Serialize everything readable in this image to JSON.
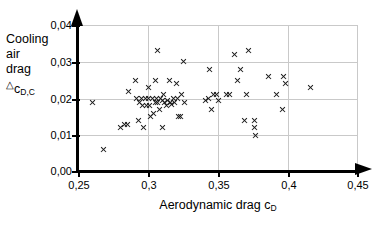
{
  "chart_data": {
    "type": "scatter",
    "title": "",
    "xlabel": "Aerodynamic drag c_D",
    "ylabel": "Cooling air drag Δc_D,C",
    "xlim": [
      0.25,
      0.45
    ],
    "ylim": [
      0.0,
      0.04
    ],
    "xticks": [
      "0,25",
      "0,3",
      "0,35",
      "0,4",
      "0,45"
    ],
    "xtick_values": [
      0.25,
      0.3,
      0.35,
      0.4,
      0.45
    ],
    "yticks": [
      "0,00",
      "0,01",
      "0,02",
      "0,03",
      "0,04"
    ],
    "ytick_values": [
      0.0,
      0.01,
      0.02,
      0.03,
      0.04
    ],
    "grid": true,
    "legend": false,
    "marker": "x",
    "marker_color": "#1a1a1a",
    "points": [
      [
        0.26,
        0.019
      ],
      [
        0.268,
        0.006
      ],
      [
        0.28,
        0.012
      ],
      [
        0.283,
        0.013
      ],
      [
        0.285,
        0.013
      ],
      [
        0.286,
        0.022
      ],
      [
        0.291,
        0.025
      ],
      [
        0.292,
        0.02
      ],
      [
        0.293,
        0.014
      ],
      [
        0.294,
        0.019
      ],
      [
        0.295,
        0.02
      ],
      [
        0.296,
        0.018
      ],
      [
        0.297,
        0.012
      ],
      [
        0.298,
        0.02
      ],
      [
        0.299,
        0.018
      ],
      [
        0.3,
        0.023
      ],
      [
        0.3,
        0.02
      ],
      [
        0.301,
        0.018
      ],
      [
        0.302,
        0.015
      ],
      [
        0.303,
        0.02
      ],
      [
        0.304,
        0.016
      ],
      [
        0.305,
        0.025
      ],
      [
        0.305,
        0.019
      ],
      [
        0.306,
        0.02
      ],
      [
        0.307,
        0.033
      ],
      [
        0.307,
        0.019
      ],
      [
        0.308,
        0.017
      ],
      [
        0.309,
        0.02
      ],
      [
        0.31,
        0.0195
      ],
      [
        0.31,
        0.012
      ],
      [
        0.311,
        0.021
      ],
      [
        0.312,
        0.019
      ],
      [
        0.313,
        0.018
      ],
      [
        0.314,
        0.0195
      ],
      [
        0.315,
        0.025
      ],
      [
        0.316,
        0.019
      ],
      [
        0.317,
        0.0185
      ],
      [
        0.318,
        0.02
      ],
      [
        0.319,
        0.019
      ],
      [
        0.32,
        0.024
      ],
      [
        0.321,
        0.02
      ],
      [
        0.322,
        0.015
      ],
      [
        0.323,
        0.015
      ],
      [
        0.324,
        0.021
      ],
      [
        0.325,
        0.03
      ],
      [
        0.326,
        0.019
      ],
      [
        0.341,
        0.0195
      ],
      [
        0.343,
        0.02
      ],
      [
        0.344,
        0.028
      ],
      [
        0.345,
        0.017
      ],
      [
        0.347,
        0.021
      ],
      [
        0.349,
        0.021
      ],
      [
        0.35,
        0.0195
      ],
      [
        0.356,
        0.021
      ],
      [
        0.358,
        0.021
      ],
      [
        0.362,
        0.032
      ],
      [
        0.364,
        0.025
      ],
      [
        0.366,
        0.028
      ],
      [
        0.369,
        0.014
      ],
      [
        0.37,
        0.021
      ],
      [
        0.372,
        0.033
      ],
      [
        0.376,
        0.014
      ],
      [
        0.376,
        0.012
      ],
      [
        0.377,
        0.01
      ],
      [
        0.386,
        0.026
      ],
      [
        0.392,
        0.021
      ],
      [
        0.396,
        0.017
      ],
      [
        0.397,
        0.026
      ],
      [
        0.398,
        0.024
      ],
      [
        0.416,
        0.023
      ]
    ]
  }
}
